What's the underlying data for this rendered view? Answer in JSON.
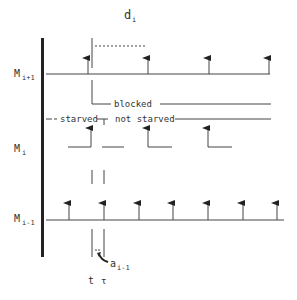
{
  "title": "d",
  "title_sub": "i",
  "colors": {
    "line": "#444444",
    "axis": "#222222",
    "text": "#333333",
    "background": "#ffffff"
  },
  "axis_labels": {
    "upper": {
      "main": "M",
      "sub": "i+1"
    },
    "middle": {
      "main": "M",
      "sub": "i"
    },
    "lower": {
      "main": "M",
      "sub": "i-1"
    }
  },
  "state_labels": {
    "blocked": "blocked",
    "starved": "starved",
    "not_starved": "not starved"
  },
  "annotations": {
    "a": {
      "main": "a",
      "sub": "i-1"
    },
    "t_lower": "t",
    "t_upper": "τ"
  },
  "timelines": {
    "upper": {
      "y": 74,
      "x_start": 46,
      "x_end": 270,
      "arrows_x": [
        88,
        148,
        209,
        269
      ]
    },
    "lower": {
      "y": 220,
      "x_start": 46,
      "x_end": 284,
      "arrows_x": [
        69,
        104,
        139,
        173,
        208,
        243,
        277
      ]
    }
  },
  "icons": {
    "event-arrow": "up-arrow",
    "pointer-arrow": "curved-arrow"
  }
}
